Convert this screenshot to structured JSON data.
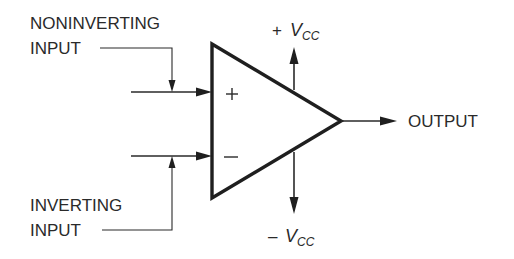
{
  "diagram": {
    "type": "op-amp schematic symbol",
    "labels": {
      "noninverting_line1": "NONINVERTING",
      "noninverting_line2": "INPUT",
      "inverting_line1": "INVERTING",
      "inverting_line2": "INPUT",
      "output": "OUTPUT",
      "pos_supply_sign": "+",
      "pos_supply_v": "V",
      "pos_supply_sub": "CC",
      "neg_supply_sign": "–",
      "neg_supply_v": "V",
      "neg_supply_sub": "CC",
      "plus_terminal": "+",
      "minus_terminal": "–"
    },
    "colors": {
      "ink": "#2a2a2a",
      "background": "#ffffff"
    },
    "nodes": [
      {
        "id": "noninverting-input",
        "label": "NONINVERTING INPUT",
        "terminal": "+"
      },
      {
        "id": "inverting-input",
        "label": "INVERTING INPUT",
        "terminal": "-"
      },
      {
        "id": "output",
        "label": "OUTPUT"
      },
      {
        "id": "pos-supply",
        "label": "+VCC"
      },
      {
        "id": "neg-supply",
        "label": "-VCC"
      }
    ],
    "edges": [
      {
        "from": "noninverting-input",
        "to": "op-amp",
        "direction": "into"
      },
      {
        "from": "inverting-input",
        "to": "op-amp",
        "direction": "into"
      },
      {
        "from": "op-amp",
        "to": "output",
        "direction": "out"
      },
      {
        "from": "op-amp",
        "to": "pos-supply",
        "direction": "up"
      },
      {
        "from": "op-amp",
        "to": "neg-supply",
        "direction": "down"
      }
    ]
  }
}
